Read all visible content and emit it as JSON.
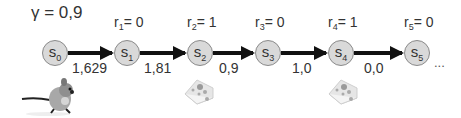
{
  "gamma_label": "γ = 0,9",
  "states": [
    {
      "name": "s",
      "index": "0"
    },
    {
      "name": "s",
      "index": "1"
    },
    {
      "name": "s",
      "index": "2"
    },
    {
      "name": "s",
      "index": "3"
    },
    {
      "name": "s",
      "index": "4"
    },
    {
      "name": "s",
      "index": "5"
    }
  ],
  "rewards": [
    {
      "r": "r",
      "index": "1",
      "value": "= 0"
    },
    {
      "r": "r",
      "index": "2",
      "value": "= 1"
    },
    {
      "r": "r",
      "index": "3",
      "value": "= 0"
    },
    {
      "r": "r",
      "index": "4",
      "value": "= 1"
    },
    {
      "r": "r",
      "index": "5",
      "value": "= 0"
    }
  ],
  "values": [
    "1,629",
    "1,81",
    "0,9",
    "1,0",
    "0,0"
  ],
  "ellipsis": "...",
  "images": {
    "agent": "mouse",
    "reward_item": "cheese"
  }
}
